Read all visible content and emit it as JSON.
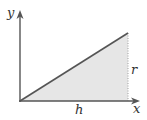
{
  "diagram": {
    "axes": {
      "x_label": "x",
      "y_label": "y"
    },
    "labels": {
      "height": "r",
      "base": "h"
    },
    "colors": {
      "axis": "#555555",
      "hypotenuse": "#555555",
      "fill": "#e6e6e6",
      "dotted_edge": "#999999",
      "text": "#333333"
    }
  }
}
